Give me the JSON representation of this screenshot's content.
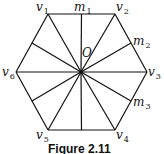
{
  "diagram": {
    "vertices": [
      {
        "name": "v1",
        "base": "v",
        "sub": "1",
        "x": 48,
        "y": 14,
        "lx": 36,
        "ly": 11
      },
      {
        "name": "v2",
        "base": "v",
        "sub": "2",
        "x": 115,
        "y": 14,
        "lx": 116,
        "ly": 11
      },
      {
        "name": "v3",
        "base": "v",
        "sub": "3",
        "x": 147,
        "y": 72,
        "lx": 148,
        "ly": 76
      },
      {
        "name": "v4",
        "base": "v",
        "sub": "4",
        "x": 115,
        "y": 130,
        "lx": 116,
        "ly": 139
      },
      {
        "name": "v5",
        "base": "v",
        "sub": "5",
        "x": 48,
        "y": 130,
        "lx": 36,
        "ly": 139
      },
      {
        "name": "v6",
        "base": "v",
        "sub": "6",
        "x": 16,
        "y": 72,
        "lx": 2,
        "ly": 76
      }
    ],
    "midpoints": [
      {
        "name": "m1",
        "base": "m",
        "sub": "1",
        "x": 81,
        "y": 14,
        "lx": 74,
        "ly": 11
      },
      {
        "name": "m2",
        "base": "m",
        "sub": "2",
        "x": 131,
        "y": 43,
        "lx": 133,
        "ly": 45
      },
      {
        "name": "m3",
        "base": "m",
        "sub": "3",
        "x": 131,
        "y": 101,
        "lx": 133,
        "ly": 106
      }
    ],
    "center": {
      "name": "O",
      "x": 81,
      "y": 72,
      "lx": 82,
      "ly": 57
    },
    "caption": "Figure 2.11"
  }
}
